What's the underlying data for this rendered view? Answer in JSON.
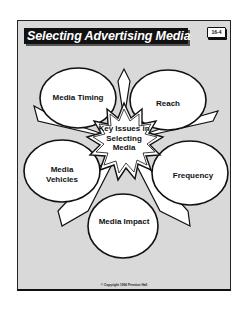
{
  "slide": {
    "title": "Selecting Advertising Media",
    "badge": "16-4",
    "center": "Key Issues in Selecting Media",
    "issues": [
      {
        "label": "Media Timing"
      },
      {
        "label": "Reach"
      },
      {
        "label": "Media Vehicles"
      },
      {
        "label": "Frequency"
      },
      {
        "label": "Media Impact"
      }
    ],
    "copyright": "© Copyright 1996 Prentice Hall"
  }
}
